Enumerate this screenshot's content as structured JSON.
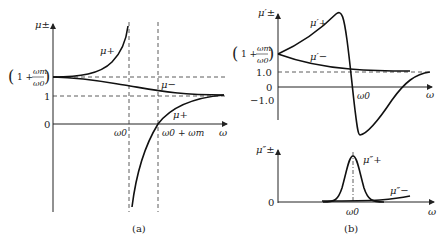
{
  "panel_a": {
    "caption": "(a)",
    "y_axis_label": "μ±",
    "x_axis_label": "ω",
    "y_ticks": {
      "upper_level": "(1 + ωm/ω0)",
      "upper_num": "1 +",
      "upper_frac_top": "ωm",
      "upper_frac_bot": "ω0",
      "one": "1",
      "zero": "0"
    },
    "x_ticks": {
      "omega0": "ω0",
      "omega0_plus_m": "ω0 + ωm"
    },
    "curve_labels": {
      "mu_plus_upper": "μ+",
      "mu_minus": "μ−",
      "mu_plus_lower": "μ+"
    }
  },
  "panel_b": {
    "caption": "(b)",
    "upper": {
      "y_axis_label": "μ′±",
      "x_axis_label": "ω",
      "y_ticks": {
        "upper_level": "(1 + ωm/ω0)",
        "upper_num": "1 +",
        "upper_frac_top": "ωm",
        "upper_frac_bot": "ω0",
        "one": "1.0",
        "zero": "0",
        "minus_one": "−1.0"
      },
      "x_ticks": {
        "omega0": "ω0"
      },
      "curve_labels": {
        "mu_prime_plus": "μ′+",
        "mu_prime_minus": "μ′−"
      }
    },
    "lower": {
      "y_axis_label": "μ″±",
      "x_axis_label": "ω",
      "y_ticks": {
        "zero": "0"
      },
      "x_ticks": {
        "omega0": "ω0"
      },
      "curve_labels": {
        "mu_dprime_plus": "μ″+",
        "mu_dprime_minus": "μ″−"
      }
    }
  }
}
